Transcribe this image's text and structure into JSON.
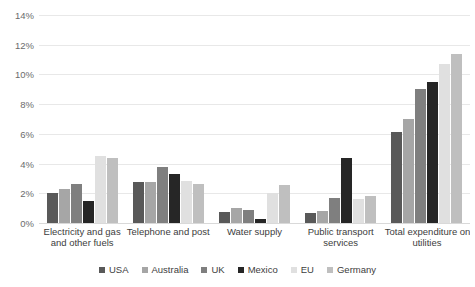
{
  "chart_data": {
    "type": "bar",
    "title": "",
    "subtitle": "",
    "xlabel": "",
    "ylabel": "",
    "ylim": [
      0,
      14
    ],
    "ytick_labels": [
      "14%",
      "12%",
      "10%",
      "8%",
      "6%",
      "4%",
      "2%",
      "0%"
    ],
    "ytick_values": [
      14,
      12,
      10,
      8,
      6,
      4,
      2,
      0
    ],
    "grid": true,
    "legend_position": "bottom",
    "categories": [
      "Electricity and gas and other fuels",
      "Telephone and post",
      "Water supply",
      "Public transport services",
      "Total expenditure on utilities"
    ],
    "category_lines": [
      [
        "Electricity and gas",
        "and other fuels"
      ],
      [
        "Telephone and post"
      ],
      [
        "Water supply"
      ],
      [
        "Public transport",
        "services"
      ],
      [
        "Total expenditure on",
        "utilities"
      ]
    ],
    "series": [
      {
        "name": "USA",
        "color": "#595959",
        "values": [
          2.0,
          2.75,
          0.75,
          0.65,
          6.1
        ]
      },
      {
        "name": "Australia",
        "color": "#a6a6a6",
        "values": [
          2.3,
          2.75,
          1.0,
          0.8,
          7.0
        ]
      },
      {
        "name": "UK",
        "color": "#7f7f7f",
        "values": [
          2.6,
          3.8,
          0.85,
          1.7,
          9.0
        ]
      },
      {
        "name": "Mexico",
        "color": "#262626",
        "values": [
          1.5,
          3.3,
          0.25,
          4.35,
          9.5
        ]
      },
      {
        "name": "EU",
        "color": "#e0e0e0",
        "values": [
          4.5,
          2.85,
          2.0,
          1.6,
          10.7
        ]
      },
      {
        "name": "Germany",
        "color": "#bfbfbf",
        "values": [
          4.4,
          2.6,
          2.55,
          1.8,
          11.4
        ]
      }
    ]
  },
  "axis": {
    "grid_color": "#e8e8e8",
    "baseline_color": "#d9d9d9",
    "tick_text_color": "#6b6b6b"
  }
}
